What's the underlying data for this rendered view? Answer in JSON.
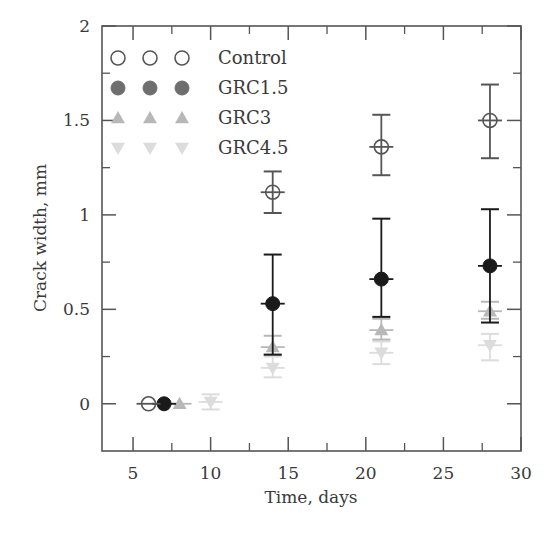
{
  "chart_data": {
    "type": "scatter",
    "title": "",
    "xlabel": "Time, days",
    "ylabel": "Crack width, mm",
    "xlim": [
      3,
      30
    ],
    "ylim": [
      -0.25,
      2
    ],
    "xticks": [
      5,
      10,
      15,
      20,
      25,
      30
    ],
    "xticks_minor": [
      7.5,
      12.5,
      17.5,
      22.5,
      27.5
    ],
    "yticks": [
      0,
      0.5,
      1,
      1.5,
      2
    ],
    "yticks_labels": [
      "0",
      "0.5",
      "1",
      "1.5",
      "2"
    ],
    "yticks_minor": [
      0.25,
      0.75,
      1.25,
      1.75
    ],
    "grid": false,
    "legend_position": "upper left",
    "series": [
      {
        "name": "Control",
        "marker": "open-circle",
        "color": "#555555",
        "x": [
          6,
          14,
          21,
          28
        ],
        "y": [
          0,
          1.12,
          1.36,
          1.5
        ],
        "err_low": [
          0,
          1.01,
          1.21,
          1.3
        ],
        "err_high": [
          0,
          1.23,
          1.53,
          1.69
        ]
      },
      {
        "name": "GRC1.5",
        "marker": "filled-circle",
        "color": "#1a1a1a",
        "legend_color": "#6e6e6e",
        "x": [
          7,
          14,
          21,
          28
        ],
        "y": [
          0,
          0.53,
          0.66,
          0.73
        ],
        "err_low": [
          0,
          0.26,
          0.46,
          0.43
        ],
        "err_high": [
          0,
          0.79,
          0.98,
          1.03
        ]
      },
      {
        "name": "GRC3",
        "marker": "triangle-up",
        "color": "#b8b8b8",
        "x": [
          8,
          14,
          21,
          28
        ],
        "y": [
          0,
          0.3,
          0.39,
          0.49
        ],
        "err_low": [
          0,
          0.26,
          0.34,
          0.45
        ],
        "err_high": [
          0,
          0.36,
          0.45,
          0.54
        ]
      },
      {
        "name": "GRC4.5",
        "marker": "triangle-down",
        "color": "#dcdcdc",
        "x": [
          10,
          14,
          21,
          28
        ],
        "y": [
          0.01,
          0.19,
          0.27,
          0.31
        ],
        "err_low": [
          -0.03,
          0.14,
          0.21,
          0.23
        ],
        "err_high": [
          0.05,
          0.25,
          0.33,
          0.37
        ]
      }
    ]
  },
  "axis": {
    "xlabel": "Time, days",
    "ylabel": "Crack width, mm"
  },
  "legend": {
    "items": [
      {
        "label": "Control"
      },
      {
        "label": "GRC1.5"
      },
      {
        "label": "GRC3"
      },
      {
        "label": "GRC4.5"
      }
    ]
  }
}
